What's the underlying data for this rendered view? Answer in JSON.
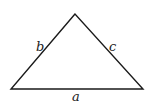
{
  "diagram": {
    "type": "triangle",
    "vertices": {
      "apex": [
        75,
        14
      ],
      "bottom_left": [
        11,
        89
      ],
      "bottom_right": [
        143,
        89
      ]
    },
    "labels": {
      "side_a": "a",
      "side_b": "b",
      "side_c": "c"
    },
    "stroke_color": "#1a1a1a",
    "background": "#ffffff"
  }
}
